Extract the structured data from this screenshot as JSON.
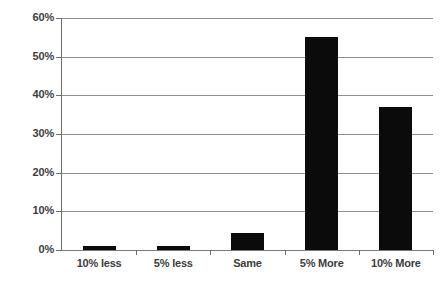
{
  "chart_data": {
    "type": "bar",
    "title": "",
    "subtitle": "",
    "xlabel": "",
    "ylabel": "",
    "categories": [
      "10% less",
      "5% less",
      "Same",
      "5% More",
      "10% More"
    ],
    "values": [
      1,
      1,
      4.5,
      55,
      37
    ],
    "value_labels": [
      "1%",
      "1%",
      "4.5%",
      "55%",
      "37%"
    ],
    "ylim": [
      0,
      60
    ],
    "ytick_values": [
      0,
      10,
      20,
      30,
      40,
      50,
      60
    ],
    "ytick_labels": [
      "0%",
      "10%",
      "20%",
      "30%",
      "40%",
      "50%",
      "60%"
    ],
    "grid": true,
    "grid_axis": "y",
    "legend": false,
    "legend_position": "none",
    "series": [
      {
        "name": "",
        "values": [
          1,
          1,
          4.5,
          55,
          37
        ]
      }
    ],
    "colors": {
      "bar": "#0b0b0b",
      "gridline": "#8f8f8f",
      "axis": "#6e6e6e",
      "text": "#3d3d3d",
      "background": "#ffffff"
    }
  }
}
